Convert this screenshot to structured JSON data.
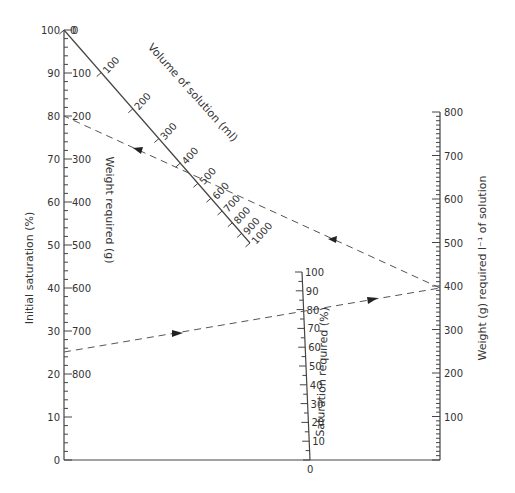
{
  "axes": {
    "initial_saturation": {
      "label": "Initial saturation (%)",
      "ticks": [
        "100",
        "90",
        "80",
        "70",
        "60",
        "50",
        "40",
        "30",
        "20",
        "10",
        "0"
      ]
    },
    "weight_required_left": {
      "label": "Weight required (g)",
      "ticks": [
        "0",
        "100",
        "200",
        "300",
        "400",
        "500",
        "600",
        "700",
        "800"
      ]
    },
    "volume_of_solution": {
      "label": "Volume of solution (ml)",
      "ticks": [
        "100",
        "200",
        "300",
        "400",
        "500",
        "600",
        "700",
        "800",
        "900",
        "1000"
      ]
    },
    "saturation_required": {
      "label": "Saturation required (%)",
      "ticks": [
        "100",
        "90",
        "80",
        "70",
        "60",
        "50",
        "40",
        "30",
        "20",
        "10",
        "0"
      ]
    },
    "weight_per_litre": {
      "label": "Weight (g) required l⁻¹ of solution",
      "ticks": [
        "800",
        "700",
        "600",
        "500",
        "400",
        "300",
        "200",
        "100"
      ]
    }
  },
  "example_lines": [
    {
      "name": "line-1",
      "from": "Initial saturation 25%",
      "to": "Weight 390 g/l",
      "via": "Saturation required 80%"
    },
    {
      "name": "line-2",
      "from": "Weight 390 g/l",
      "to": "Weight required 200 g",
      "via": "Volume 500 ml"
    }
  ],
  "chart_data": {
    "type": "nomogram",
    "title": "",
    "scales": [
      {
        "name": "Initial saturation (%)",
        "min": 0,
        "max": 100,
        "position": "left"
      },
      {
        "name": "Weight required (g)",
        "min": 0,
        "max": 800,
        "position": "left-inner",
        "reversed": true
      },
      {
        "name": "Volume of solution (ml)",
        "min": 0,
        "max": 1000,
        "position": "diagonal"
      },
      {
        "name": "Saturation required (%)",
        "min": 0,
        "max": 100,
        "position": "center"
      },
      {
        "name": "Weight (g) required l-1 of solution",
        "min": 0,
        "max": 800,
        "position": "right"
      }
    ],
    "example": {
      "initial_saturation": 25,
      "saturation_required": 80,
      "weight_per_litre": 390,
      "volume_ml": 500,
      "weight_required_g": 200
    }
  }
}
